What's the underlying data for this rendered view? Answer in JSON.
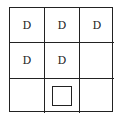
{
  "grid": {
    "rows": 3,
    "cols": 3,
    "cells": [
      [
        "D",
        "D",
        "D"
      ],
      [
        "D",
        "D",
        ""
      ],
      [
        "",
        "",
        ""
      ]
    ],
    "marker": {
      "row": 2,
      "col": 1,
      "shape": "empty-square"
    }
  },
  "colors": {
    "line": "#222222",
    "background": "#ffffff"
  }
}
